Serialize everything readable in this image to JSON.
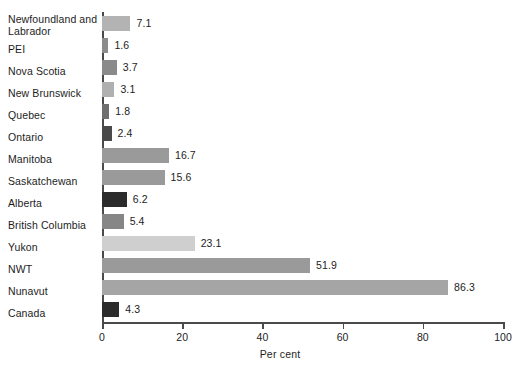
{
  "chart_data": {
    "type": "bar",
    "orientation": "horizontal",
    "title": "",
    "xlabel": "Per cent",
    "ylabel": "",
    "xlim": [
      0,
      100
    ],
    "xticks": [
      0,
      20,
      40,
      60,
      80,
      100
    ],
    "grid": false,
    "legend": "none",
    "categories": [
      "Newfoundland and Labrador",
      "PEI",
      "Nova Scotia",
      "New Brunswick",
      "Quebec",
      "Ontario",
      "Manitoba",
      "Saskatchewan",
      "Alberta",
      "British Columbia",
      "Yukon",
      "NWT",
      "Nunavut",
      "Canada"
    ],
    "values": [
      7.1,
      1.6,
      3.7,
      3.1,
      1.8,
      2.4,
      16.7,
      15.6,
      6.2,
      5.4,
      23.1,
      51.9,
      86.3,
      4.3
    ],
    "value_labels": [
      "7.1",
      "1.6",
      "3.7",
      "3.1",
      "1.8",
      "2.4",
      "16.7",
      "15.6",
      "6.2",
      "5.4",
      "23.1",
      "51.9",
      "86.3",
      "4.3"
    ],
    "bar_colors": [
      "#b3b3b3",
      "#8c8c8c",
      "#8a8a8a",
      "#b0b0b0",
      "#6e6e6e",
      "#4a4a4a",
      "#9a9a9a",
      "#9a9a9a",
      "#2b2b2b",
      "#868686",
      "#cfcfcf",
      "#9a9a9a",
      "#a5a5a5",
      "#2b2b2b"
    ],
    "axis_color": "#4a4a4a",
    "text_color": "#1d1d1d",
    "background": "#ffffff"
  }
}
